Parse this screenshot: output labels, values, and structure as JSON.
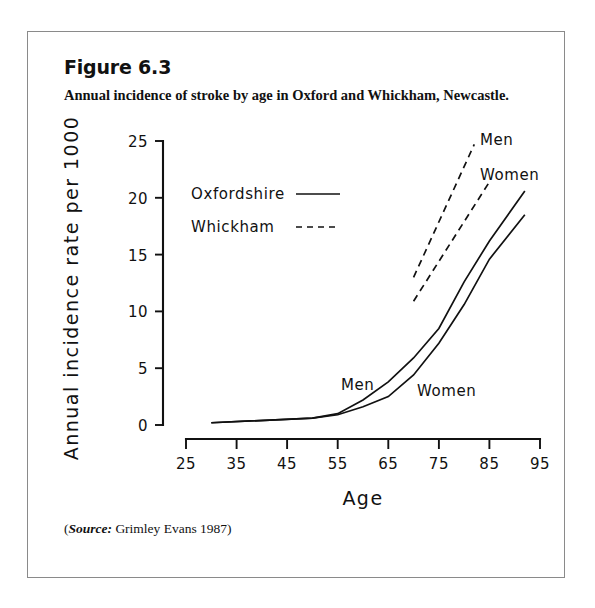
{
  "figure": {
    "number": "Figure 6.3",
    "caption": "Annual incidence of stroke by age in Oxford and Whickham, Newcastle.",
    "source_label": "Source:",
    "source_text": " Grimley Evans 1987)",
    "source_open_paren": "(",
    "source_full": "(Source: Grimley Evans 1987)"
  },
  "chart_data": {
    "type": "line",
    "title": "Annual incidence of stroke by age in Oxford and Whickham, Newcastle.",
    "xlabel": "Age",
    "ylabel": "Annual incidence rate per 1000",
    "xlim": [
      25,
      95
    ],
    "ylim": [
      0,
      25
    ],
    "xticks": [
      "25",
      "35",
      "45",
      "55",
      "65",
      "75",
      "85",
      "95"
    ],
    "yticks": [
      "0",
      "5",
      "10",
      "15",
      "20",
      "25"
    ],
    "grid": false,
    "legend_position": "upper-left-inside",
    "legend": [
      {
        "label": "Oxfordshire",
        "style": "solid"
      },
      {
        "label": "Whickham",
        "style": "dashed"
      }
    ],
    "series": [
      {
        "name": "Oxfordshire Men",
        "style": "solid",
        "inline_label": "Men",
        "x": [
          30,
          50,
          55,
          60,
          65,
          70,
          75,
          80,
          85,
          92
        ],
        "y": [
          0.2,
          0.6,
          1.0,
          2.2,
          3.8,
          5.9,
          8.5,
          12.6,
          16.2,
          20.6
        ]
      },
      {
        "name": "Oxfordshire Women",
        "style": "solid",
        "inline_label": "Women",
        "x": [
          30,
          50,
          55,
          60,
          65,
          70,
          75,
          80,
          85,
          92
        ],
        "y": [
          0.2,
          0.6,
          0.9,
          1.6,
          2.5,
          4.4,
          7.2,
          10.6,
          14.6,
          18.5
        ]
      },
      {
        "name": "Whickham Men",
        "style": "dashed",
        "inline_label": "Men",
        "x": [
          70,
          82
        ],
        "y": [
          13.0,
          24.7
        ]
      },
      {
        "name": "Whickham Women",
        "style": "dashed",
        "inline_label": "Women",
        "x": [
          70,
          85
        ],
        "y": [
          10.9,
          21.4
        ]
      }
    ],
    "annotations": [
      {
        "text": "Men",
        "x": 62,
        "y": 7.6
      },
      {
        "text": "Women",
        "x": 75,
        "y": 6.9
      },
      {
        "text": "Men",
        "x": 85,
        "y": 24.3
      },
      {
        "text": "Women",
        "x": 85,
        "y": 21.0
      }
    ]
  }
}
